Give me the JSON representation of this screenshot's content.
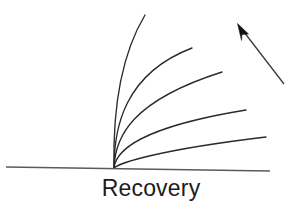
{
  "figure": {
    "title": "Recovery",
    "background_color": "#ffffff",
    "width": 302,
    "height": 217,
    "caption_text": "Recovery",
    "caption_color": "#1c1c1c",
    "curve_color": "#2a2a2a",
    "axis_color": "#5a5a5a",
    "arrow_color": "#121212"
  },
  "chart_data": {
    "type": "line",
    "title": "Recovery",
    "xlabel": "Recovery",
    "ylabel": "",
    "grid": false,
    "legend": false,
    "annotations": [
      {
        "name": "direction-arrow",
        "label": "",
        "from_x": 285,
        "from_y": 85,
        "to_x": 238,
        "to_y": 24,
        "description": "arrow pointing up and to the left indicating increasing trend"
      }
    ],
    "axis_line": {
      "x_start": 6,
      "y_start": 167,
      "x_end": 270,
      "y_end": 171
    },
    "origin": {
      "x": 114,
      "y": 168
    },
    "series": [
      {
        "name": "curve-1",
        "path": "M114,168 C113,120 118,60 145,15",
        "end_x": 145,
        "end_y": 15
      },
      {
        "name": "curve-2",
        "path": "M114,168 C114,128 124,74 192,48",
        "end_x": 192,
        "end_y": 48
      },
      {
        "name": "curve-3",
        "path": "M114,168 C115,137 131,101 222,72",
        "end_x": 222,
        "end_y": 72
      },
      {
        "name": "curve-4",
        "path": "M114,168 C116,150 142,127 246,110",
        "end_x": 246,
        "end_y": 110
      },
      {
        "name": "curve-5",
        "path": "M114,168 C120,163 157,150 266,137",
        "end_x": 266,
        "end_y": 137
      }
    ]
  }
}
